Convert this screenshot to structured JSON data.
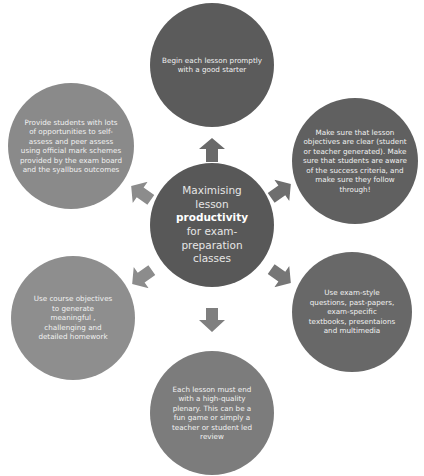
{
  "diagram": {
    "type": "radial-cycle",
    "center": {
      "line1": "Maximising lesson",
      "bold": "productivity",
      "line2": "for exam-preparation classes"
    },
    "nodes": [
      {
        "id": "top",
        "text": "Begin each lesson promptly with a good starter",
        "color": "#5b5b5b"
      },
      {
        "id": "top-right",
        "text": "Make sure that lesson objectives are clear (student or teacher generated). Make sure that students are aware of the success criteria, and make sure they follow through!",
        "color": "#606060"
      },
      {
        "id": "bottom-right",
        "text": "Use exam-style questions, past-papers, exam-specific textbooks, presentaions and multimedia",
        "color": "#686868"
      },
      {
        "id": "bottom",
        "text": "Each lesson must end with a high-quality plenary. This can be a fun game or simply a teacher or student led review",
        "color": "#7c7c7c"
      },
      {
        "id": "bottom-left",
        "text": "Use course objectives to generate meaningful , challenging and detailed homework",
        "color": "#8e8e8e"
      },
      {
        "id": "top-left",
        "text": "Provide students with lots of opportunities to self-assess and peer assess using official mark schemes provided by the exam board and the syallbus outcomes",
        "color": "#8a8a8a"
      }
    ],
    "center_color": "#585858",
    "arrow_color": "#7a7a7a"
  }
}
